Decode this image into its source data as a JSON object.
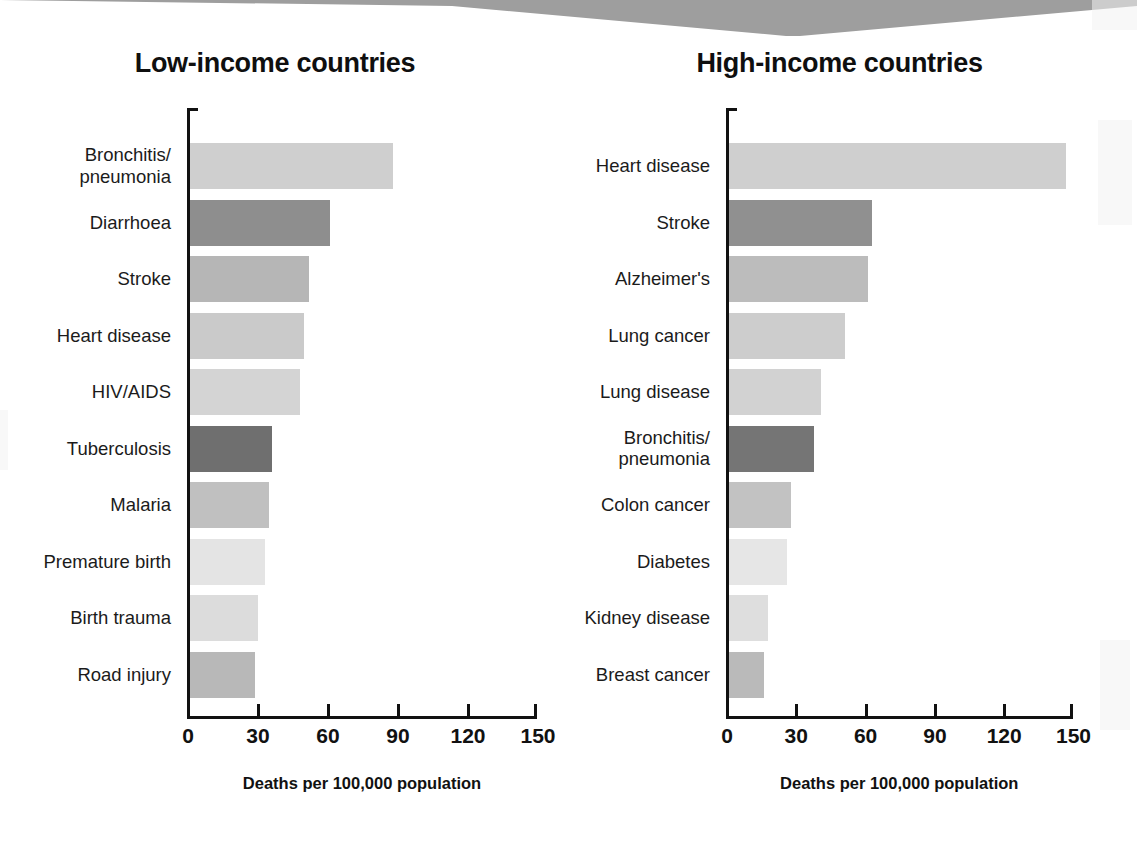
{
  "chart_data": [
    {
      "type": "bar",
      "orientation": "horizontal",
      "title": "Low-income countries",
      "xlabel": "Deaths per 100,000 population",
      "ylabel": "",
      "xlim": [
        0,
        150
      ],
      "xticks": [
        "0",
        "30",
        "60",
        "90",
        "120",
        "150"
      ],
      "grid": false,
      "legend": "none",
      "categories": [
        "Bronchitis/\npneumonia",
        "Diarrhoea",
        "Stroke",
        "Heart disease",
        "HIV/AIDS",
        "Tuberculosis",
        "Malaria",
        "Premature birth",
        "Birth trauma",
        "Road injury"
      ],
      "values": [
        87,
        60,
        51,
        49,
        47,
        35,
        34,
        32,
        29,
        28
      ],
      "bar_colors": [
        "#cfcfcf",
        "#8e8e8e",
        "#b6b6b6",
        "#cacaca",
        "#d4d4d4",
        "#6f6f6f",
        "#c0c0c0",
        "#e4e4e4",
        "#dcdcdc",
        "#b8b8b8"
      ]
    },
    {
      "type": "bar",
      "orientation": "horizontal",
      "title": "High-income countries",
      "xlabel": "Deaths per 100,000 population",
      "ylabel": "",
      "xlim": [
        0,
        150
      ],
      "xticks": [
        "0",
        "30",
        "60",
        "90",
        "120",
        "150"
      ],
      "grid": false,
      "legend": "none",
      "categories": [
        "Heart disease",
        "Stroke",
        "Alzheimer's",
        "Lung cancer",
        "Lung disease",
        "Bronchitis/\npneumonia",
        "Colon cancer",
        "Diabetes",
        "Kidney disease",
        "Breast cancer"
      ],
      "values": [
        146,
        62,
        60,
        50,
        40,
        37,
        27,
        25,
        17,
        15
      ],
      "bar_colors": [
        "#cfcfcf",
        "#909090",
        "#bcbcbc",
        "#cdcdcd",
        "#d2d2d2",
        "#757575",
        "#c2c2c2",
        "#e6e6e6",
        "#dedede",
        "#bababa"
      ]
    }
  ],
  "decor": {
    "band_color": "#9e9e9e"
  }
}
